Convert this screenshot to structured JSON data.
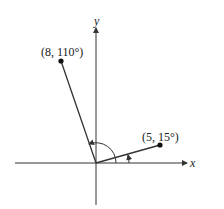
{
  "diagram": {
    "type": "polar-coordinates",
    "axes": {
      "x_label": "x",
      "y_label": "y"
    },
    "points": [
      {
        "label": "(8, 110°)",
        "r": 8,
        "theta_deg": 110
      },
      {
        "label": "(5, 15°)",
        "r": 5,
        "theta_deg": 15
      }
    ],
    "colors": {
      "line": "#333333",
      "point": "#111111"
    }
  }
}
